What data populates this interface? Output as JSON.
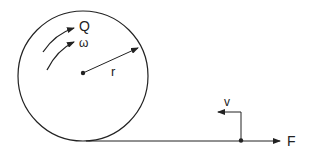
{
  "diagram": {
    "labels": {
      "torque": "Q",
      "angular_velocity": "ω",
      "radius": "r",
      "velocity": "v",
      "force": "F"
    },
    "colors": {
      "stroke": "#222222",
      "background": "#ffffff"
    }
  }
}
